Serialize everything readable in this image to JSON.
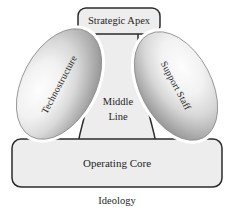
{
  "diagram": {
    "background_color": "#ffffff",
    "shape_fill": "#ededed",
    "shape_stroke": "#2b2b2b",
    "ellipse_edge_color": "#8c8c8c",
    "ellipse_highlight_color": "#fdfdfd",
    "text_color": "#1f1f1f"
  },
  "parts": {
    "strategic_apex": {
      "label": "Strategic Apex",
      "shape": "rounded-rectangle"
    },
    "technostructure": {
      "label": "Technostructure",
      "shape": "ellipse",
      "rotation_deg": -62
    },
    "support_staff": {
      "label": "Support Staff",
      "shape": "ellipse",
      "rotation_deg": 62
    },
    "middle_line": {
      "label_line_1": "Middle",
      "label_line_2": "Line",
      "shape": "column"
    },
    "operating_core": {
      "label": "Operating Core",
      "shape": "rounded-rectangle"
    },
    "ideology": {
      "label": "Ideology",
      "shape": "caption"
    }
  }
}
